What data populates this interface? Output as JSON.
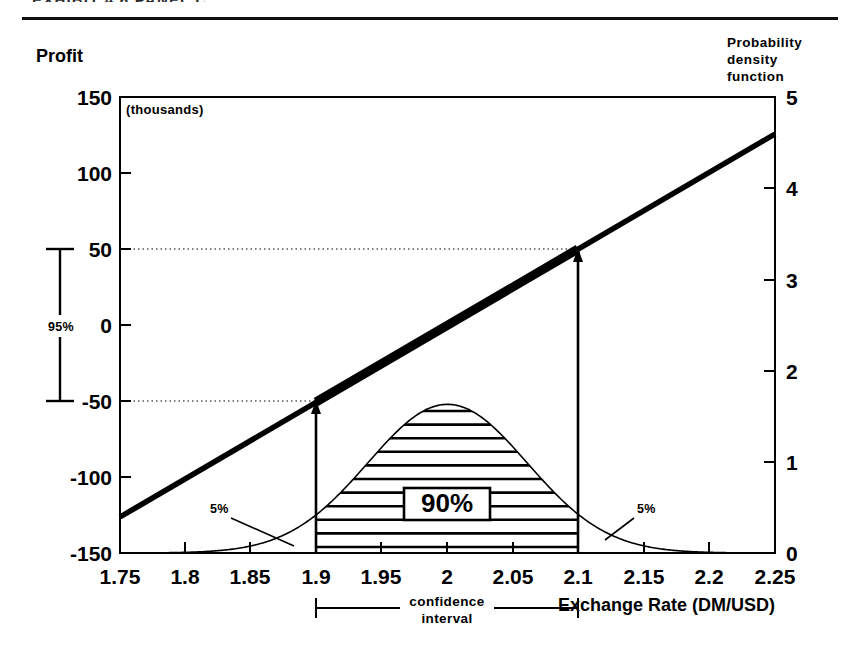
{
  "page": {
    "cut_header_text": "EXHIBIT 4.6   PANEL C",
    "background": "#ffffff",
    "ink": "#000000"
  },
  "chart_data": {
    "type": "line",
    "title": "",
    "subtitle": "",
    "xlabel": "Exchange Rate (DM/USD)",
    "ylabel": "Profit",
    "y_units_note": "(thousands)",
    "y2label": "Probability density function",
    "xlim": [
      1.75,
      2.25
    ],
    "ylim": [
      -150,
      150
    ],
    "y2lim": [
      0,
      5
    ],
    "grid": false,
    "legend_position": "none",
    "x_ticks": [
      "1.75",
      "1.8",
      "1.85",
      "1.9",
      "1.95",
      "2",
      "2.05",
      "2.1",
      "2.15",
      "2.2",
      "2.25"
    ],
    "x_tick_values": [
      1.75,
      1.8,
      1.85,
      1.9,
      1.95,
      2.0,
      2.05,
      2.1,
      2.15,
      2.2,
      2.25
    ],
    "y_ticks": [
      "150",
      "100",
      "50",
      "0",
      "-50",
      "-100",
      "-150"
    ],
    "y_tick_values": [
      150,
      100,
      50,
      0,
      -50,
      -100,
      -150
    ],
    "y2_ticks": [
      "5",
      "4",
      "3",
      "2",
      "1",
      "0"
    ],
    "y2_tick_values": [
      5,
      4,
      3,
      2,
      1,
      0
    ],
    "series": [
      {
        "name": "Profit",
        "axis": "left",
        "style": "thick-line",
        "x": [
          1.75,
          1.8,
          1.85,
          1.9,
          1.95,
          2.0,
          2.05,
          2.1,
          2.15,
          2.2,
          2.25
        ],
        "values": [
          -124,
          -99,
          -74,
          -50,
          -25,
          0,
          25,
          50,
          76,
          101,
          127
        ]
      },
      {
        "name": "Probability density function",
        "axis": "right",
        "style": "thin-curve",
        "distribution": "normal",
        "mean": 2.0,
        "std_dev": 0.0608,
        "peak_value": 1.63,
        "x": [
          1.75,
          1.78,
          1.81,
          1.84,
          1.87,
          1.9,
          1.93,
          1.96,
          1.99,
          2.0,
          2.01,
          2.04,
          2.07,
          2.1,
          2.13,
          2.16,
          2.19,
          2.22,
          2.25
        ],
        "values": [
          0.01,
          0.03,
          0.08,
          0.2,
          0.45,
          0.84,
          1.26,
          1.55,
          1.63,
          1.63,
          1.63,
          1.45,
          1.06,
          0.63,
          0.31,
          0.12,
          0.04,
          0.01,
          0.0
        ]
      }
    ],
    "annotations": [
      {
        "name": "shaded-region-label",
        "text": "90%",
        "x": 2.0,
        "y2": 0.62,
        "meaning": "central probability mass between 1.9 and 2.1"
      },
      {
        "name": "left-tail-label",
        "text": "5%",
        "x": 1.862,
        "y2": 0.52,
        "meaning": "left tail probability below 1.9"
      },
      {
        "name": "right-tail-label",
        "text": "5%",
        "x": 2.165,
        "y2": 0.52,
        "meaning": "right tail probability above 2.1"
      },
      {
        "name": "profit-interval-bracket",
        "text": "95%",
        "meaning": "profit range from -50 to +50 thousand"
      },
      {
        "name": "confidence-interval-bracket",
        "text": "confidence interval",
        "from": 1.9,
        "to": 2.1
      }
    ],
    "reference_lines": [
      {
        "name": "upper-profit-reference",
        "y": 50,
        "x_from": 1.75,
        "x_to": 2.1,
        "style": "dotted"
      },
      {
        "name": "lower-profit-reference",
        "y": -50,
        "x_from": 1.75,
        "x_to": 1.9,
        "style": "dotted"
      }
    ],
    "arrows": [
      {
        "name": "lower-bound-arrow",
        "x": 1.9,
        "from_y": -150,
        "to_y": -50
      },
      {
        "name": "upper-bound-arrow",
        "x": 2.1,
        "from_y": -150,
        "to_y": 50
      }
    ],
    "highlighted_segment": {
      "name": "profit-ci-segment",
      "x_from": 1.9,
      "x_to": 2.1,
      "y_from": -50,
      "y_to": 50
    }
  },
  "labels": {
    "profit_axis_title": "Profit",
    "thousands_note": "(thousands)",
    "pdf_title_line1": "Probability",
    "pdf_title_line2": "density",
    "pdf_title_line3": "function",
    "x_axis_title": "Exchange Rate (DM/USD)",
    "ci_line1": "confidence",
    "ci_line2": "interval",
    "pct_95": "95%",
    "pct_90": "90%",
    "pct_5_left": "5%",
    "pct_5_right": "5%"
  }
}
